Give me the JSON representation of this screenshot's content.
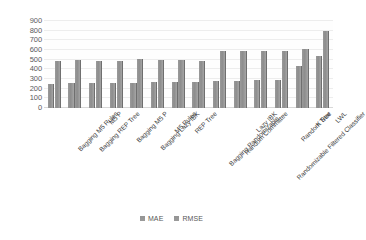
{
  "chart_data": {
    "type": "bar",
    "title": "",
    "xlabel": "",
    "ylabel": "",
    "ylim": [
      0,
      900
    ],
    "ytick_step": 100,
    "yticks": [
      900,
      800,
      700,
      600,
      500,
      400,
      300,
      200,
      100,
      0
    ],
    "grid": true,
    "legend_position": "bottom-center",
    "categories": [
      "Bagging M5 Rules",
      "Bagging REP Tree",
      "M5 P",
      "Bagging M5 P",
      "Bagging Lazy IBK",
      "M5 Rules",
      "REP Tree",
      "Bagging Randomizable…",
      "Random Committee",
      "Lazy IBK",
      "Randomizable Filtered Classifier",
      "Random Tree",
      "K Star",
      "LWL"
    ],
    "series": [
      {
        "name": "MAE",
        "color": "#8f8f8f",
        "values": [
          250,
          255,
          255,
          258,
          262,
          268,
          265,
          272,
          282,
          280,
          285,
          288,
          430,
          540
        ]
      },
      {
        "name": "RMSE",
        "color": "#8f8f8f",
        "values": [
          482,
          492,
          488,
          485,
          508,
          492,
          495,
          490,
          588,
          588,
          586,
          585,
          606,
          800
        ]
      }
    ]
  },
  "legend": {
    "items": [
      {
        "label": "MAE",
        "swatch": "legend-swatch-mae"
      },
      {
        "label": "RMSE",
        "swatch": "legend-swatch-rmse"
      }
    ]
  },
  "title_strip": {
    "ghost_text": "· · · · · · · · ·"
  }
}
